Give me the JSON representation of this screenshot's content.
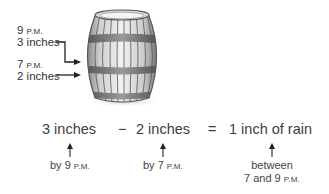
{
  "barrel": {
    "label_9pm": {
      "time_num": "9",
      "time_suffix": "P.M.",
      "amount": "3 inches"
    },
    "label_7pm": {
      "time_num": "7",
      "time_suffix": "P.M.",
      "amount": "2 inches"
    }
  },
  "equation": {
    "term1": "3 inches",
    "minus": "−",
    "term2": "2 inches",
    "equals": "=",
    "result": "1 inch of rain"
  },
  "captions": {
    "term1": {
      "prefix": "by 9",
      "suffix": "P.M."
    },
    "term2": {
      "prefix": "by 7",
      "suffix": "P.M."
    },
    "result": {
      "line1": "between",
      "line2_prefix": "7 and 9",
      "line2_suffix": "P.M."
    }
  },
  "colors": {
    "text": "#3a3a3a",
    "arrow": "#222222",
    "barrel_light": "#e6e6e6",
    "barrel_dark": "#6e6e6e"
  }
}
